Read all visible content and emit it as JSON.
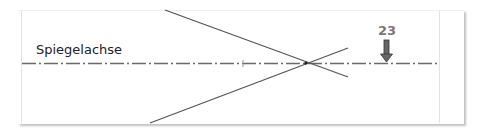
{
  "diagram": {
    "axis": {
      "label": "Spiegelachse",
      "style": "dash-dot",
      "color": "#666666"
    },
    "lines": [
      {
        "name": "upper-ray",
        "from": [
          165,
          10
        ],
        "to": [
          348,
          76
        ],
        "color": "#555555"
      },
      {
        "name": "lower-ray",
        "from": [
          150,
          123
        ],
        "to": [
          348,
          46
        ],
        "color": "#555555"
      }
    ],
    "intersection": [
      306,
      63
    ],
    "marker": {
      "label": "23",
      "color": "#666666"
    }
  }
}
